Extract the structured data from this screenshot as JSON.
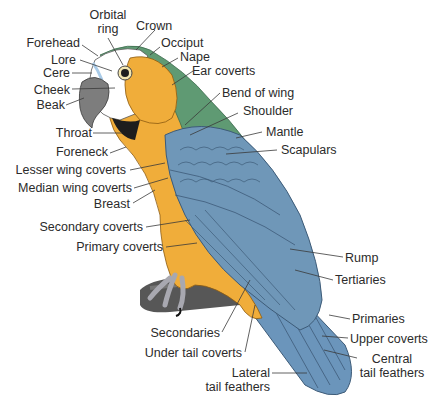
{
  "diagram": {
    "colors": {
      "head_white": "#ffffff",
      "head_green": "#5f9a73",
      "body_yellow": "#f0ad3a",
      "wing_blue": "#6f97b8",
      "wing_dark": "#4f7496",
      "beak_gray": "#7d7d7d",
      "branch": "#555555",
      "text": "#2b2b2b",
      "leader": "#3a3a3a"
    },
    "labels": {
      "orbital_ring": {
        "line1": "Orbital",
        "line2": "ring"
      },
      "crown": "Crown",
      "occiput": "Occiput",
      "nape": "Nape",
      "ear_coverts": "Ear coverts",
      "forehead": "Forehead",
      "lore": "Lore",
      "cere": "Cere",
      "cheek": "Cheek",
      "beak": "Beak",
      "bend_of_wing": "Bend of wing",
      "shoulder": "Shoulder",
      "mantle": "Mantle",
      "scapulars": "Scapulars",
      "throat": "Throat",
      "foreneck": "Foreneck",
      "lesser_wing_coverts": "Lesser wing coverts",
      "median_wing_coverts": "Median wing coverts",
      "breast": "Breast",
      "secondary_coverts": "Secondary coverts",
      "primary_coverts": "Primary coverts",
      "rump": "Rump",
      "tertiaries": "Tertiaries",
      "primaries": "Primaries",
      "secondaries": "Secondaries",
      "upper_coverts": "Upper coverts",
      "under_tail_coverts": "Under tail coverts",
      "central_tail_feathers": {
        "line1": "Central",
        "line2": "tail feathers"
      },
      "lateral_tail_feathers": {
        "line1": "Lateral",
        "line2": "tail feathers"
      }
    }
  }
}
